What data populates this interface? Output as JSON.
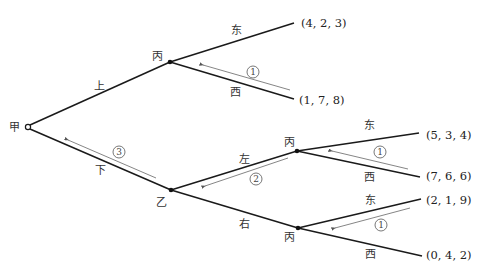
{
  "diagram": {
    "type": "game-tree",
    "root": {
      "player": "甲"
    },
    "nodes": [
      {
        "id": "n-jia",
        "player": "甲",
        "x": 28,
        "y": 127,
        "kind": "root"
      },
      {
        "id": "n-bing-top",
        "player": "丙",
        "x": 170,
        "y": 62,
        "kind": "decision"
      },
      {
        "id": "n-yi",
        "player": "乙",
        "x": 171,
        "y": 190,
        "kind": "decision"
      },
      {
        "id": "n-bing-mid",
        "player": "丙",
        "x": 297,
        "y": 151,
        "kind": "decision"
      },
      {
        "id": "n-bing-bot",
        "player": "丙",
        "x": 298,
        "y": 228,
        "kind": "decision"
      }
    ],
    "edges": [
      {
        "from": "n-jia",
        "to": "n-bing-top",
        "label": "上"
      },
      {
        "from": "n-jia",
        "to": "n-yi",
        "label": "下"
      },
      {
        "from": "n-bing-top",
        "to": "t1",
        "label": "东"
      },
      {
        "from": "n-bing-top",
        "to": "t2",
        "label": "西"
      },
      {
        "from": "n-yi",
        "to": "n-bing-mid",
        "label": "左"
      },
      {
        "from": "n-yi",
        "to": "n-bing-bot",
        "label": "右"
      },
      {
        "from": "n-bing-mid",
        "to": "t3",
        "label": "东"
      },
      {
        "from": "n-bing-mid",
        "to": "t4",
        "label": "西"
      },
      {
        "from": "n-bing-bot",
        "to": "t5",
        "label": "东"
      },
      {
        "from": "n-bing-bot",
        "to": "t6",
        "label": "西"
      }
    ],
    "terminals": [
      {
        "id": "t1",
        "payoff": "(4,2,3)"
      },
      {
        "id": "t2",
        "payoff": "(1,7,8)"
      },
      {
        "id": "t3",
        "payoff": "(5,3,4)"
      },
      {
        "id": "t4",
        "payoff": "(7,6,6)"
      },
      {
        "id": "t5",
        "payoff": "(2,1,9)"
      },
      {
        "id": "t6",
        "payoff": "(0,4,2)"
      }
    ],
    "backward_induction_steps": [
      {
        "step": "①",
        "along": "西",
        "at": "n-bing-top"
      },
      {
        "step": "①",
        "along": "西",
        "at": "n-bing-mid"
      },
      {
        "step": "①",
        "along": "东",
        "at": "n-bing-bot"
      },
      {
        "step": "②",
        "along": "左",
        "at": "n-yi"
      },
      {
        "step": "③",
        "along": "下",
        "at": "n-jia"
      }
    ]
  },
  "labels": {
    "jia": "甲",
    "yi": "乙",
    "bing_top": "丙",
    "bing_mid": "丙",
    "bing_bot": "丙",
    "shang": "上",
    "xia": "下",
    "zuo": "左",
    "you": "右",
    "dong_top": "东",
    "xi_top": "西",
    "dong_mid": "东",
    "xi_mid": "西",
    "dong_bot": "东",
    "xi_bot": "西",
    "step1_top": "1",
    "step1_mid": "1",
    "step1_bot": "1",
    "step2": "2",
    "step3": "3"
  },
  "payoffs": {
    "t1": "(4, 2, 3)",
    "t2": "(1, 7, 8)",
    "t3": "(5, 3, 4)",
    "t4": "(7, 6, 6)",
    "t5": "(2, 1, 9)",
    "t6": "(0, 4, 2)"
  }
}
